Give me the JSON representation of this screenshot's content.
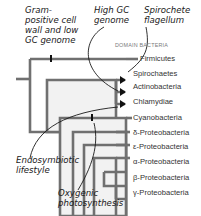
{
  "diagram": {
    "domain_label": "DOMAIN BACTERIA",
    "taxa": [
      {
        "label": "Firmicutes"
      },
      {
        "label": "Spirochaetes"
      },
      {
        "label": "Actinobacteria"
      },
      {
        "label": "Chlamydiae"
      },
      {
        "label": "Cyanobacteria"
      },
      {
        "label": "δ-Proteobacteria"
      },
      {
        "label": "ε-Proteobacteria"
      },
      {
        "label": "α-Proteobacteria"
      },
      {
        "label": "β-Proteobacteria"
      },
      {
        "label": "γ-Proteobacteria"
      }
    ],
    "annotations": {
      "gram_positive": [
        "Gram-",
        "positive cell",
        "wall and low",
        "GC genome"
      ],
      "high_gc": [
        "High GC",
        "genome"
      ],
      "spirochete": [
        "Spirochete",
        "flagellum"
      ],
      "endosymbiotic": [
        "Endosymbiotic",
        "lifestyle"
      ],
      "oxygenic": [
        "Oxygenic",
        "photosynthesis"
      ]
    },
    "colors": {
      "branch_outline": "#6e6e6e",
      "branch_fill": "#f0f0f0",
      "marker": "#111111",
      "text": "#1a1a1a"
    }
  }
}
